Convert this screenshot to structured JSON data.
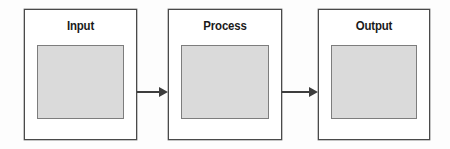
{
  "diagram": {
    "title": "Input Process Output",
    "type": "flow-diagram",
    "background_color": "#fdfdfd",
    "box_border_color": "#4a4a4a",
    "inner_fill_color": "#dadada",
    "inner_border_color": "#7d7d7d",
    "arrow_color": "#3d3d3d",
    "label_color": "#1a1a1a",
    "stages": [
      {
        "label": "Input",
        "x": 24,
        "y": 9,
        "width": 113,
        "height": 131
      },
      {
        "label": "Process",
        "x": 168,
        "y": 9,
        "width": 114,
        "height": 131
      },
      {
        "label": "Output",
        "x": 318,
        "y": 9,
        "width": 112,
        "height": 131
      }
    ],
    "connectors": [
      {
        "name": "input-to-process",
        "from": "Input",
        "to": "Process",
        "x": 137,
        "y": 92,
        "length": 31
      },
      {
        "name": "process-to-output",
        "from": "Process",
        "to": "Output",
        "x": 282,
        "y": 92,
        "length": 36
      }
    ]
  }
}
